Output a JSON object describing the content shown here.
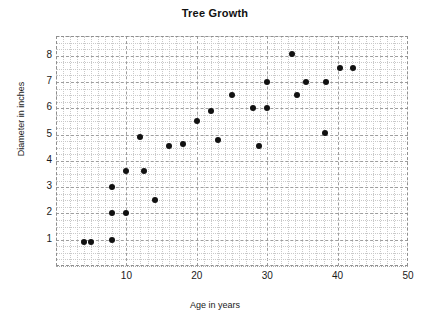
{
  "chart_data": {
    "type": "scatter",
    "title": "Tree Growth",
    "xlabel": "Age in years",
    "ylabel": "Diameter in inches",
    "xlim": [
      0,
      50
    ],
    "ylim": [
      0,
      8.75
    ],
    "xticks": [
      10,
      20,
      30,
      40,
      50
    ],
    "yticks": [
      1,
      2,
      3,
      4,
      5,
      6,
      7,
      8
    ],
    "grid": true,
    "grid_major_style": "dashed",
    "grid_minor_style": "dotted",
    "legend": "none",
    "marker": "filled-circle",
    "marker_color": "#111111",
    "points": [
      {
        "x": 4.0,
        "y": 0.9
      },
      {
        "x": 5.0,
        "y": 0.9
      },
      {
        "x": 8.0,
        "y": 1.0
      },
      {
        "x": 8.0,
        "y": 2.0
      },
      {
        "x": 10.0,
        "y": 2.0
      },
      {
        "x": 8.0,
        "y": 3.0
      },
      {
        "x": 10.0,
        "y": 3.6
      },
      {
        "x": 12.5,
        "y": 3.6
      },
      {
        "x": 14.0,
        "y": 2.5
      },
      {
        "x": 12.0,
        "y": 4.9
      },
      {
        "x": 16.0,
        "y": 4.55
      },
      {
        "x": 18.0,
        "y": 4.65
      },
      {
        "x": 20.0,
        "y": 5.5
      },
      {
        "x": 22.0,
        "y": 5.9
      },
      {
        "x": 23.0,
        "y": 4.8
      },
      {
        "x": 25.0,
        "y": 6.5
      },
      {
        "x": 28.0,
        "y": 6.0
      },
      {
        "x": 30.0,
        "y": 6.0
      },
      {
        "x": 28.8,
        "y": 4.55
      },
      {
        "x": 30.0,
        "y": 7.0
      },
      {
        "x": 33.5,
        "y": 8.05
      },
      {
        "x": 34.3,
        "y": 6.5
      },
      {
        "x": 35.5,
        "y": 7.0
      },
      {
        "x": 38.3,
        "y": 7.0
      },
      {
        "x": 38.2,
        "y": 5.05
      },
      {
        "x": 40.3,
        "y": 7.55
      },
      {
        "x": 42.2,
        "y": 7.55
      }
    ]
  },
  "colors": {
    "marker": "#111111",
    "grid_major": "#9e9e9e",
    "grid_minor": "#c9c9c9",
    "text": "#1a1a1a",
    "background": "#ffffff"
  }
}
